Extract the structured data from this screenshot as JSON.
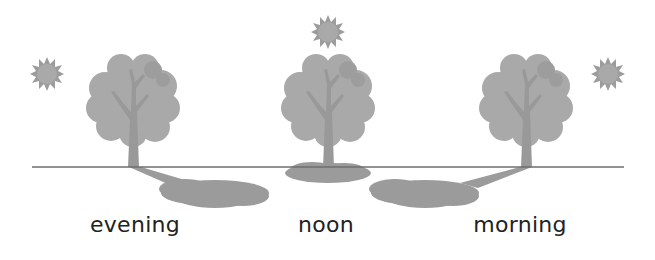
{
  "diagram": {
    "title": "",
    "colors": {
      "background": "#ffffff",
      "ground_line": "#6e6e6e",
      "sun": "#9c9c9c",
      "sun_core": "#a8a8a8",
      "tree_crown": "#a9a9a9",
      "tree_crown_shade": "#9a9a9a",
      "trunk": "#999999",
      "shadow": "#9b9b9b",
      "label": "#222222"
    },
    "scenes": [
      {
        "id": "evening",
        "label": "evening",
        "sun_position": "left-low",
        "shadow_direction": "right-long"
      },
      {
        "id": "noon",
        "label": "noon",
        "sun_position": "overhead",
        "shadow_direction": "under-short"
      },
      {
        "id": "morning",
        "label": "morning",
        "sun_position": "right-low",
        "shadow_direction": "left-long"
      }
    ]
  }
}
